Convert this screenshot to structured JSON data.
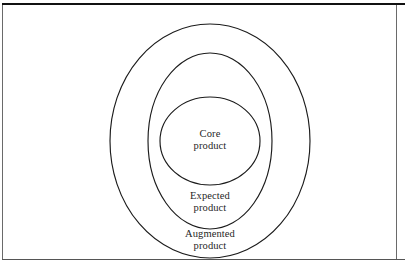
{
  "figure": {
    "name": "three-ring-product-levels-diagram",
    "type": "concentric-rings",
    "background_color": "#ffffff",
    "stroke_color": "#1b1b1b",
    "rule_color_top": "#111111",
    "rule_color_bottom": "#555555",
    "rings": [
      {
        "id": "augmented",
        "level": 3,
        "label_line1": "Augmented",
        "label_line2": "product",
        "order_from_center": "outermost"
      },
      {
        "id": "expected",
        "level": 2,
        "label_line1": "Expected",
        "label_line2": "product",
        "order_from_center": "middle"
      },
      {
        "id": "core",
        "level": 1,
        "label_line1": "Core",
        "label_line2": "product",
        "order_from_center": "innermost"
      }
    ]
  }
}
